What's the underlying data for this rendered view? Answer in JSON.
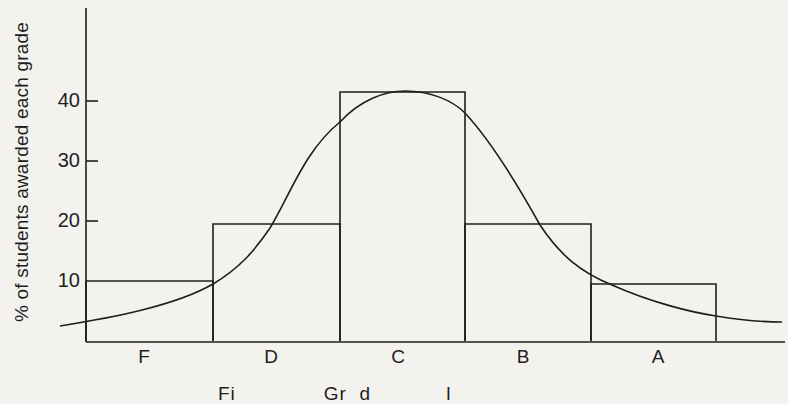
{
  "chart_data": {
    "type": "bar",
    "title": "",
    "xlabel": "",
    "ylabel": "% of students awarded each grade",
    "categories": [
      "F",
      "D",
      "C",
      "B",
      "A"
    ],
    "values": [
      10,
      19.5,
      41.5,
      19.5,
      9.5
    ],
    "ylim": [
      0,
      55
    ],
    "yticks": [
      10,
      20,
      30,
      40
    ],
    "grid": false,
    "legend": null,
    "overlay": {
      "type": "line",
      "name": "normal distribution curve",
      "shape": "bell curve peaking at ~41.5% over grade C, tails near ~2.5% at both ends"
    },
    "caption_partial": "Fi... Grading ... (caption cropped at bottom edge)"
  },
  "axis": {
    "ylabel": "% of students awarded each grade",
    "ticks": [
      {
        "label": "40",
        "value": 40
      },
      {
        "label": "30",
        "value": 30
      },
      {
        "label": "20",
        "value": 20
      },
      {
        "label": "10",
        "value": 10
      }
    ],
    "categories": [
      "F",
      "D",
      "C",
      "B",
      "A"
    ]
  },
  "colors": {
    "background": "#f3f2ef",
    "ink": "#1e1e1e"
  }
}
